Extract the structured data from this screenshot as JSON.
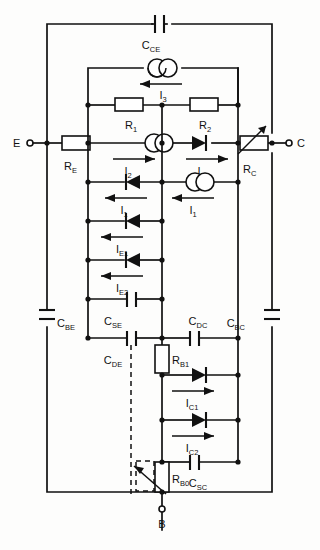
{
  "figure": {
    "kind": "circuit-schematic",
    "terminals": [
      {
        "name": "emitter-terminal",
        "label": "E",
        "x": 292,
        "y": 143
      },
      {
        "name": "collector-terminal",
        "label": "C",
        "x": 292,
        "y": 143
      },
      {
        "name": "base-terminal",
        "label": "B",
        "x": 162,
        "y": 512
      }
    ],
    "labels": {
      "E": "E",
      "C": "C",
      "B": "B",
      "C_CE": "C",
      "C_CE_sub": "CE",
      "C_BE": "C",
      "C_BE_sub": "BE",
      "C_BC": "C",
      "C_BC_sub": "BC",
      "C_SE": "C",
      "C_SE_sub": "SE",
      "C_SC": "C",
      "C_SC_sub": "SC",
      "C_DE": "C",
      "C_DE_sub": "DE",
      "C_DC": "C",
      "C_DC_sub": "DC",
      "R_E": "R",
      "R_E_sub": "E",
      "R_C": "R",
      "R_C_sub": "C",
      "R_1": "R",
      "R_1_sub": "1",
      "R_2": "R",
      "R_2_sub": "2",
      "R_B1": "R",
      "R_B1_sub": "B1",
      "R_B0": "R",
      "R_B0_sub": "B0",
      "I_1": "I",
      "I_1_sub": "1",
      "I_2": "I",
      "I_2_sub": "2",
      "I_3": "I",
      "I_3_sub": "3",
      "I_E1": "I",
      "I_E1_sub": "E1",
      "I_E2": "I",
      "I_E2_sub": "E2",
      "I_C1": "I",
      "I_C1_sub": "C1",
      "I_C2": "I",
      "I_C2_sub": "C2"
    },
    "components": [
      {
        "id": "C_CE",
        "type": "capacitor",
        "label": "C_CE",
        "orientation": "horizontal",
        "note": "collector-emitter capacitance across outer loop top"
      },
      {
        "id": "I_3",
        "type": "current-source",
        "label": "I_3",
        "arrow": "left",
        "note": "source between inner left and inner right rails"
      },
      {
        "id": "R_1",
        "type": "resistor",
        "label": "R_1",
        "orientation": "horizontal"
      },
      {
        "id": "R_2",
        "type": "resistor",
        "label": "R_2",
        "orientation": "horizontal"
      },
      {
        "id": "R_E",
        "type": "resistor",
        "label": "R_E",
        "orientation": "horizontal"
      },
      {
        "id": "R_C",
        "type": "variable-resistor",
        "label": "R_C",
        "orientation": "horizontal"
      },
      {
        "id": "I_2_left",
        "type": "current-source",
        "label": "I_2",
        "arrow": "right"
      },
      {
        "id": "I_2_right",
        "type": "diode",
        "label": "I_2",
        "arrow": "right",
        "direction": "right"
      },
      {
        "id": "I_1_left",
        "type": "diode",
        "label": "I_1",
        "arrow": "left",
        "direction": "left"
      },
      {
        "id": "I_1_right",
        "type": "current-source",
        "label": "I_1",
        "arrow": "left"
      },
      {
        "id": "I_E1",
        "type": "diode",
        "label": "I_E1",
        "arrow": "left",
        "direction": "left"
      },
      {
        "id": "I_E2",
        "type": "diode",
        "label": "I_E2",
        "arrow": "left",
        "direction": "left"
      },
      {
        "id": "C_SE",
        "type": "capacitor",
        "label": "C_SE",
        "orientation": "horizontal"
      },
      {
        "id": "C_DE",
        "type": "capacitor",
        "label": "C_DE",
        "orientation": "horizontal"
      },
      {
        "id": "C_DC",
        "type": "capacitor",
        "label": "C_DC",
        "orientation": "horizontal"
      },
      {
        "id": "C_SC",
        "type": "capacitor",
        "label": "C_SC",
        "orientation": "horizontal"
      },
      {
        "id": "C_BE",
        "type": "capacitor",
        "label": "C_BE",
        "orientation": "vertical"
      },
      {
        "id": "C_BC",
        "type": "capacitor",
        "label": "C_BC",
        "orientation": "vertical"
      },
      {
        "id": "R_B1",
        "type": "resistor",
        "label": "R_B1",
        "orientation": "vertical"
      },
      {
        "id": "R_B0",
        "type": "variable-resistor",
        "label": "R_B0",
        "orientation": "vertical"
      },
      {
        "id": "I_C1",
        "type": "diode",
        "label": "I_C1",
        "arrow": "right",
        "direction": "right"
      },
      {
        "id": "I_C2",
        "type": "diode",
        "label": "I_C2",
        "arrow": "right",
        "direction": "right"
      }
    ],
    "colors": {
      "line": "#111111",
      "text": "#111111",
      "background": "#fdfdfc"
    }
  }
}
